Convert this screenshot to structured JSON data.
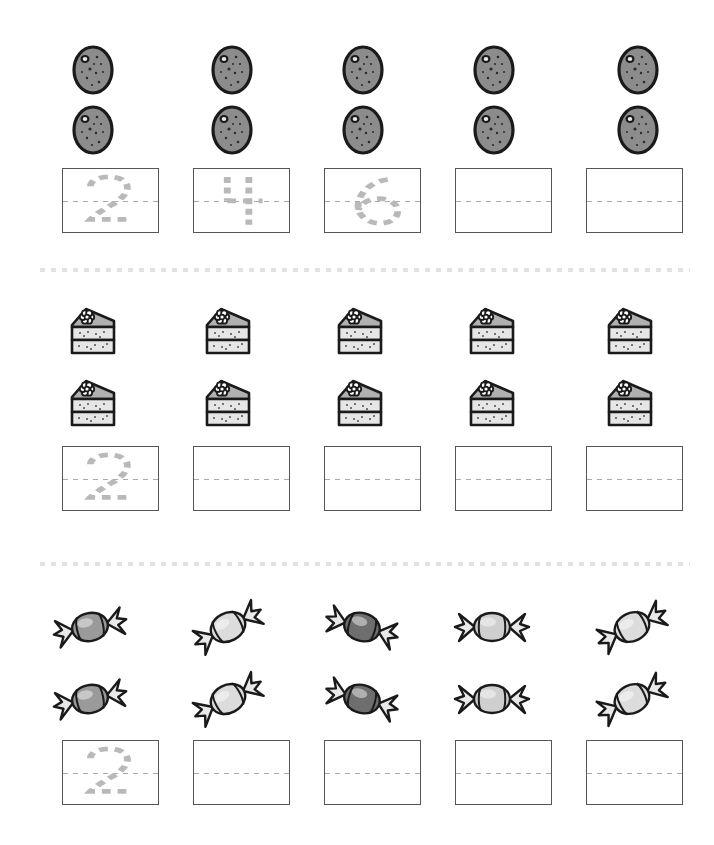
{
  "worksheet": {
    "title": "Counting and number tracing worksheet",
    "page_width": 714,
    "page_height": 845,
    "background_color": "#ffffff",
    "box_border_color": "#555555",
    "trace_stroke_color": "#b9b9b9",
    "divider_color": "#e2e2e2",
    "columns": 5,
    "item_rows_per_section": 2
  },
  "sections": [
    {
      "id": "section-cookies",
      "item_name": "cookie",
      "item_icon": "cookie-icon",
      "top": 20,
      "item_row_tops": [
        35,
        95
      ],
      "box_row_top": 168,
      "divider_top": null,
      "column_centers": [
        93,
        232,
        363,
        494,
        638
      ],
      "box_lefts": [
        62,
        193,
        324,
        455,
        586
      ],
      "items": [
        {
          "column": 1,
          "count": 2,
          "fill": "#8c8c8c"
        },
        {
          "column": 2,
          "count": 2,
          "fill": "#8c8c8c"
        },
        {
          "column": 3,
          "count": 2,
          "fill": "#8c8c8c"
        },
        {
          "column": 4,
          "count": 2,
          "fill": "#8c8c8c"
        },
        {
          "column": 5,
          "count": 2,
          "fill": "#8c8c8c"
        }
      ],
      "trace_boxes": [
        {
          "column": 1,
          "numeral": "2",
          "traced": true
        },
        {
          "column": 2,
          "numeral": "4",
          "traced": true
        },
        {
          "column": 3,
          "numeral": "6",
          "traced": true
        },
        {
          "column": 4,
          "numeral": "",
          "traced": false
        },
        {
          "column": 5,
          "numeral": "",
          "traced": false
        }
      ]
    },
    {
      "id": "section-cake-slices",
      "item_name": "cake slice",
      "item_icon": "cake-slice-icon",
      "top": 288,
      "item_row_tops": [
        296,
        368
      ],
      "box_row_top": 446,
      "divider_top": 268,
      "column_centers": [
        93,
        228,
        360,
        492,
        630
      ],
      "box_lefts": [
        62,
        193,
        324,
        455,
        586
      ],
      "items": [
        {
          "column": 1,
          "count": 2,
          "fill": "#d4d4d4"
        },
        {
          "column": 2,
          "count": 2,
          "fill": "#d4d4d4"
        },
        {
          "column": 3,
          "count": 2,
          "fill": "#d4d4d4"
        },
        {
          "column": 4,
          "count": 2,
          "fill": "#d4d4d4"
        },
        {
          "column": 5,
          "count": 2,
          "fill": "#d4d4d4"
        }
      ],
      "trace_boxes": [
        {
          "column": 1,
          "numeral": "2",
          "traced": true
        },
        {
          "column": 2,
          "numeral": "",
          "traced": false
        },
        {
          "column": 3,
          "numeral": "",
          "traced": false
        },
        {
          "column": 4,
          "numeral": "",
          "traced": false
        },
        {
          "column": 5,
          "numeral": "",
          "traced": false
        }
      ]
    },
    {
      "id": "section-candies",
      "item_name": "wrapped candy",
      "item_icon": "candy-icon",
      "top": 588,
      "item_row_tops": [
        592,
        664
      ],
      "box_row_top": 740,
      "divider_top": 562,
      "column_centers": [
        90,
        228,
        362,
        492,
        632
      ],
      "box_lefts": [
        62,
        193,
        324,
        455,
        586
      ],
      "items": [
        {
          "column": 1,
          "count": 2,
          "fill": "#9a9a9a",
          "rotation": -12
        },
        {
          "column": 2,
          "count": 2,
          "fill": "#dcdcdc",
          "rotation": -28
        },
        {
          "column": 3,
          "count": 2,
          "fill": "#6e6e6e",
          "rotation": 16
        },
        {
          "column": 4,
          "count": 2,
          "fill": "#cfcfcf",
          "rotation": 0
        },
        {
          "column": 5,
          "count": 2,
          "fill": "#dcdcdc",
          "rotation": -26
        }
      ],
      "trace_boxes": [
        {
          "column": 1,
          "numeral": "2",
          "traced": true
        },
        {
          "column": 2,
          "numeral": "",
          "traced": false
        },
        {
          "column": 3,
          "numeral": "",
          "traced": false
        },
        {
          "column": 4,
          "numeral": "",
          "traced": false
        },
        {
          "column": 5,
          "numeral": "",
          "traced": false
        }
      ]
    }
  ],
  "numeral_paths": {
    "2": "M 28 26 C 28 12, 50 8, 60 16 C 72 26, 64 42, 50 54 C 40 62, 32 70, 28 76 L 70 76",
    "4": "M 34 12 L 34 48 M 34 48 L 70 48 M 56 12 L 56 84",
    "6": "M 64 16 C 50 18, 36 32, 34 52 C 32 70, 44 82, 56 82 C 68 82, 76 72, 74 60 C 72 48, 60 42, 48 46 C 40 49, 35 56, 34 62"
  }
}
